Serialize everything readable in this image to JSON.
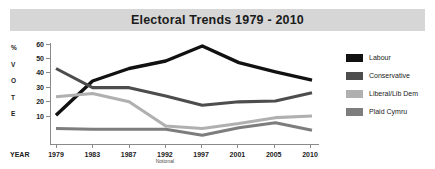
{
  "header": {
    "title": "Electoral Trends 1979 - 2010"
  },
  "axes": {
    "y_axis_title_letters": [
      "%",
      "V",
      "O",
      "T",
      "E"
    ],
    "y_ticks": [
      "60",
      "50",
      "40",
      "30",
      "20",
      "10"
    ],
    "x_axis_label": "YEAR",
    "x_ticks": [
      "1979",
      "1983",
      "1987",
      "1992",
      "1997",
      "2001",
      "2005",
      "2010"
    ],
    "x_tick_sublabels": [
      "",
      "",
      "",
      "Notional",
      "",
      "",
      "",
      ""
    ]
  },
  "legend": {
    "position": "right",
    "items": [
      {
        "label": "Labour",
        "color": "#111111"
      },
      {
        "label": "Conservative",
        "color": "#4d4d4d"
      },
      {
        "label": "Liberal/Lib Dem",
        "color": "#b0b0b0"
      },
      {
        "label": "Plaid Cymru",
        "color": "#7d7d7d"
      }
    ]
  },
  "chart_data": {
    "type": "line",
    "title": "Electoral Trends 1979 - 2010",
    "xlabel": "YEAR",
    "ylabel": "% VOTE",
    "categories": [
      "1979",
      "1983",
      "1987",
      "1992",
      "1997",
      "2001",
      "2005",
      "2010"
    ],
    "category_notes": [
      "",
      "",
      "",
      "Notional",
      "",
      "",
      "",
      ""
    ],
    "ylim": [
      0,
      60
    ],
    "ytick_values": [
      10,
      20,
      30,
      40,
      50,
      60
    ],
    "grid": false,
    "legend_position": "right",
    "series": [
      {
        "name": "Labour",
        "color": "#111111",
        "values": [
          17.0,
          37.5,
          45.0,
          49.5,
          58.5,
          48.5,
          43.0,
          38.0
        ]
      },
      {
        "name": "Conservative",
        "color": "#4d4d4d",
        "values": [
          45.0,
          33.5,
          33.5,
          28.5,
          23.0,
          25.0,
          25.5,
          30.5
        ]
      },
      {
        "name": "Liberal/Lib Dem",
        "color": "#b0b0b0",
        "values": [
          28.0,
          30.0,
          25.0,
          10.5,
          9.0,
          12.0,
          15.5,
          16.5
        ]
      },
      {
        "name": "Plaid Cymru",
        "color": "#7d7d7d",
        "values": [
          9.0,
          8.5,
          8.5,
          8.5,
          5.0,
          9.5,
          12.5,
          8.0
        ]
      }
    ]
  },
  "style": {
    "title_bar_background": "#d6d6d6",
    "axis_color": "#8a8a8a",
    "text_color": "#1b1b1b"
  }
}
